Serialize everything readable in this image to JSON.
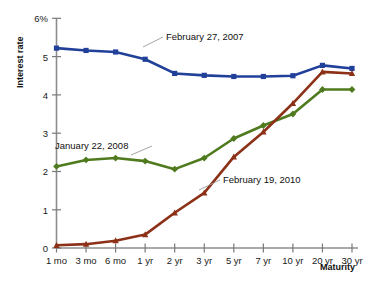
{
  "chart_data": {
    "type": "line",
    "title": "",
    "xlabel": "Maturity",
    "ylabel": "Interest rate",
    "categories": [
      "1 mo",
      "3 mo",
      "6 mo",
      "1 yr",
      "2 yr",
      "3 yr",
      "5 yr",
      "7 yr",
      "10 yr",
      "20 yr",
      "30 yr"
    ],
    "ylim": [
      0,
      6
    ],
    "yticks": [
      0,
      1,
      2,
      3,
      4,
      5,
      6
    ],
    "ytick_labels": [
      "0",
      "1",
      "2",
      "3",
      "4",
      "5",
      "6%"
    ],
    "grid": false,
    "legend": "inline-annotations",
    "series": [
      {
        "name": "February 27, 2007",
        "color": "#21409a",
        "marker": "square",
        "values": [
          5.22,
          5.16,
          5.12,
          4.93,
          4.56,
          4.51,
          4.48,
          4.48,
          4.5,
          4.77,
          4.69
        ]
      },
      {
        "name": "January 22, 2008",
        "color": "#4f7a1e",
        "marker": "diamond",
        "values": [
          2.13,
          2.3,
          2.35,
          2.27,
          2.06,
          2.35,
          2.86,
          3.2,
          3.5,
          4.14,
          4.14
        ]
      },
      {
        "name": "February 19, 2010",
        "color": "#8c3118",
        "marker": "triangle",
        "values": [
          0.07,
          0.1,
          0.19,
          0.35,
          0.92,
          1.44,
          2.38,
          3.03,
          3.78,
          4.6,
          4.56
        ]
      }
    ],
    "annotations": [
      {
        "text": "February 27, 2007",
        "series": "February 27, 2007"
      },
      {
        "text": "January 22, 2008",
        "series": "January 22, 2008"
      },
      {
        "text": "February 19, 2010",
        "series": "February 19, 2010"
      }
    ]
  }
}
